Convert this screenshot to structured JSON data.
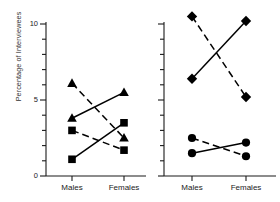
{
  "chart_data": {
    "type": "line",
    "title": "",
    "xlabel": "",
    "ylabel": "Percentage of Interviewees",
    "ylim": [
      0,
      10
    ],
    "ytick_labels": [
      "0",
      "5",
      "10"
    ],
    "ytick_values": [
      0,
      5,
      10
    ],
    "yminor_step": 1,
    "grid": false,
    "legend": "none",
    "categories": [
      "Males",
      "Females"
    ],
    "panels": [
      {
        "name": "left-panel",
        "axis_labeled": true,
        "series": [
          {
            "name": "triangle-descending",
            "marker": "triangle",
            "linestyle": "dashed",
            "color": "#000000",
            "x": [
              "Males",
              "Females"
            ],
            "values": [
              6.1,
              2.5
            ]
          },
          {
            "name": "triangle-ascending",
            "marker": "triangle",
            "linestyle": "solid",
            "color": "#000000",
            "x": [
              "Males",
              "Females"
            ],
            "values": [
              3.8,
              5.5
            ]
          },
          {
            "name": "square-descending",
            "marker": "square",
            "linestyle": "dashed",
            "color": "#000000",
            "x": [
              "Males",
              "Females"
            ],
            "values": [
              3.0,
              1.7
            ]
          },
          {
            "name": "square-ascending",
            "marker": "square",
            "linestyle": "solid",
            "color": "#000000",
            "x": [
              "Males",
              "Females"
            ],
            "values": [
              1.1,
              3.5
            ]
          }
        ]
      },
      {
        "name": "right-panel",
        "axis_labeled": false,
        "series": [
          {
            "name": "diamond-descending",
            "marker": "diamond",
            "linestyle": "dashed",
            "color": "#000000",
            "x": [
              "Males",
              "Females"
            ],
            "values": [
              10.5,
              5.2
            ]
          },
          {
            "name": "diamond-ascending",
            "marker": "diamond",
            "linestyle": "solid",
            "color": "#000000",
            "x": [
              "Males",
              "Females"
            ],
            "values": [
              6.4,
              10.2
            ]
          },
          {
            "name": "circle-descending",
            "marker": "circle",
            "linestyle": "dashed",
            "color": "#000000",
            "x": [
              "Males",
              "Females"
            ],
            "values": [
              2.5,
              1.3
            ]
          },
          {
            "name": "circle-ascending",
            "marker": "circle",
            "linestyle": "solid",
            "color": "#000000",
            "x": [
              "Males",
              "Females"
            ],
            "values": [
              1.5,
              2.2
            ]
          }
        ]
      }
    ]
  },
  "layout": {
    "axis_color": "#1a1a1a",
    "marker_color": "#000000",
    "line_color": "#000000"
  }
}
